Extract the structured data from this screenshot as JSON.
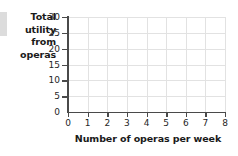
{
  "chart_data": {
    "type": "line",
    "title": "",
    "subtitle": "",
    "xlabel": "Number of operas per week",
    "ylabel": "Total utility from operas",
    "ylabel_lines": [
      "Total",
      "utility",
      "from",
      "operas"
    ],
    "xlim": [
      0,
      8
    ],
    "ylim": [
      0,
      30
    ],
    "xticks": [
      0,
      1,
      2,
      3,
      4,
      5,
      6,
      7,
      8
    ],
    "yticks": [
      0,
      5,
      10,
      15,
      20,
      25,
      30
    ],
    "xtick_labels": [
      "0",
      "1",
      "2",
      "3",
      "4",
      "5",
      "6",
      "7",
      "8"
    ],
    "ytick_labels": [
      "0",
      "5",
      "10",
      "15",
      "20",
      "25",
      "30"
    ],
    "x_major_step": 1,
    "y_major_step": 5,
    "grid": true,
    "grid_color": "#e2e2e2",
    "axis_color": "#4a4a4a",
    "background": "#ffffff",
    "legend": null,
    "legend_position": "none",
    "series": [],
    "x": [],
    "values": [],
    "annotations": [],
    "note": "Blank plotting grid — no data series plotted; axes and gridlines only."
  },
  "decor": {
    "edge_bar_color": "#dcdcdc"
  }
}
